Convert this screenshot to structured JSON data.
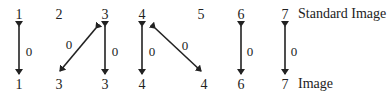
{
  "diagram": {
    "row_labels": {
      "top": "Standard Image",
      "bottom": "Image"
    },
    "top_nodes": [
      {
        "label": "1",
        "x": 19
      },
      {
        "label": "2",
        "x": 59
      },
      {
        "label": "3",
        "x": 105
      },
      {
        "label": "4",
        "x": 142
      },
      {
        "label": "5",
        "x": 201
      },
      {
        "label": "6",
        "x": 241
      },
      {
        "label": "7",
        "x": 285
      }
    ],
    "bottom_nodes": [
      {
        "label": "1",
        "x": 19
      },
      {
        "label": "3",
        "x": 59
      },
      {
        "label": "3",
        "x": 105
      },
      {
        "label": "4",
        "x": 142
      },
      {
        "label": "4",
        "x": 204
      },
      {
        "label": "6",
        "x": 241
      },
      {
        "label": "7",
        "x": 285
      }
    ],
    "edges": [
      {
        "from_top": "1",
        "to_bottom": "1",
        "weight": "0"
      },
      {
        "from_top": "3",
        "to_bottom": "3 (pos 2)",
        "weight": "0"
      },
      {
        "from_top": "3",
        "to_bottom": "3",
        "weight": "0"
      },
      {
        "from_top": "4",
        "to_bottom": "4",
        "weight": "0"
      },
      {
        "from_top": "4",
        "to_bottom": "4 (pos 5)",
        "weight": "0"
      },
      {
        "from_top": "6",
        "to_bottom": "6",
        "weight": "0"
      },
      {
        "from_top": "7",
        "to_bottom": "7",
        "weight": "0"
      }
    ]
  }
}
